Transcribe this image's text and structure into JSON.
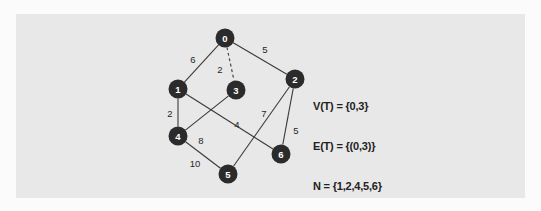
{
  "figure": {
    "panel_bg_color": "#e8e8e8",
    "page_bg_color": "#fbfbfb",
    "node_color": "#2b2b2b",
    "node_text_color": "#ffffff",
    "edge_color": "#3a3a3a",
    "label_color": "#262626"
  },
  "chart_data": {
    "type": "diagram",
    "subtype": "weighted-undirected-graph",
    "title": "",
    "nodes": [
      {
        "id": "0",
        "label": "0",
        "x": 225,
        "y": 38,
        "r": 9.5
      },
      {
        "id": "1",
        "label": "1",
        "x": 178,
        "y": 89,
        "r": 9.5
      },
      {
        "id": "2",
        "label": "2",
        "x": 295,
        "y": 79,
        "r": 9.5
      },
      {
        "id": "3",
        "label": "3",
        "x": 236,
        "y": 90,
        "r": 9.5
      },
      {
        "id": "4",
        "label": "4",
        "x": 178,
        "y": 136,
        "r": 9.5
      },
      {
        "id": "5",
        "label": "5",
        "x": 228,
        "y": 174,
        "r": 9.5
      },
      {
        "id": "6",
        "label": "6",
        "x": 281,
        "y": 154,
        "r": 9.5
      }
    ],
    "edges": [
      {
        "source": "0",
        "target": "1",
        "weight": "6",
        "style": "solid",
        "label_x": 193,
        "label_y": 59
      },
      {
        "source": "0",
        "target": "2",
        "weight": "5",
        "style": "solid",
        "label_x": 265,
        "label_y": 49
      },
      {
        "source": "0",
        "target": "3",
        "weight": "2",
        "style": "dashed",
        "label_x": 220,
        "label_y": 69
      },
      {
        "source": "1",
        "target": "4",
        "weight": "2",
        "style": "solid",
        "label_x": 170,
        "label_y": 113
      },
      {
        "source": "1",
        "target": "6",
        "weight": "4",
        "style": "solid",
        "label_x": 237,
        "label_y": 124
      },
      {
        "source": "3",
        "target": "4",
        "weight": "8",
        "style": "solid",
        "label_x": 201,
        "label_y": 140
      },
      {
        "source": "2",
        "target": "5",
        "weight": "7",
        "style": "solid",
        "label_x": 264,
        "label_y": 113
      },
      {
        "source": "2",
        "target": "6",
        "weight": "5",
        "style": "solid",
        "label_x": 296,
        "label_y": 130
      },
      {
        "source": "4",
        "target": "5",
        "weight": "10",
        "style": "solid",
        "label_x": 195,
        "label_y": 163
      }
    ],
    "legend_position": "right",
    "grid": false
  },
  "annotation": {
    "line1": "V(T) = {0,3}",
    "line2": "E(T) = {(0,3)}",
    "line3": "N = {1,2,4,5,6}"
  }
}
